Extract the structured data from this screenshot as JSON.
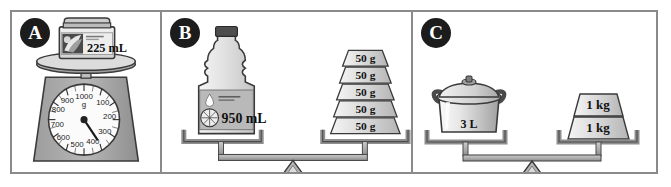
{
  "worksheet": {
    "title": "Measurement comparison panels",
    "panels": [
      {
        "id": "A",
        "badge": "A",
        "type": "dial-scale",
        "item": {
          "name": "jar",
          "label": "225 mL"
        },
        "scale": {
          "unit": "g",
          "unit_label": "g",
          "max_label": "1000",
          "tick_labels": [
            "1000",
            "100",
            "200",
            "300",
            "400",
            "500",
            "600",
            "700",
            "800",
            "900"
          ],
          "needle_value": "380"
        }
      },
      {
        "id": "B",
        "badge": "B",
        "type": "balance",
        "left": {
          "name": "bottle",
          "label": "950 mL"
        },
        "right": {
          "name": "weight-stack",
          "weights": [
            {
              "label": "50 g"
            },
            {
              "label": "50 g"
            },
            {
              "label": "50 g"
            },
            {
              "label": "50 g"
            },
            {
              "label": "50 g"
            }
          ]
        }
      },
      {
        "id": "C",
        "badge": "C",
        "type": "balance",
        "left": {
          "name": "pot",
          "label": "3 L"
        },
        "right": {
          "name": "weight-stack",
          "weights": [
            {
              "label": "1 kg"
            },
            {
              "label": "1 kg"
            }
          ]
        }
      }
    ]
  },
  "colors": {
    "frame_border": "#8a8a8a",
    "badge_bg": "#1c1c1c",
    "badge_text": "#ffffff",
    "metal_gray": "#a8a8a8",
    "light_gray": "#d8d8d8",
    "dark_outline": "#3a3a3a",
    "page_bg": "#ffffff"
  }
}
